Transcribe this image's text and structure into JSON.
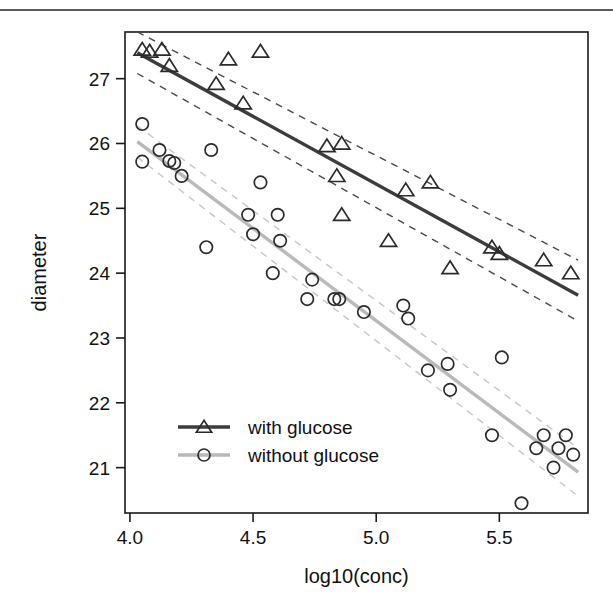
{
  "page": {
    "background_color": "#ffffff",
    "top_rule_color": "#5a5a5a"
  },
  "chart_data": {
    "type": "scatter",
    "title": "",
    "xlabel": "log10(conc)",
    "ylabel": "diameter",
    "xlim": [
      3.98,
      5.86
    ],
    "ylim": [
      20.3,
      27.72
    ],
    "xticks": [
      4.0,
      4.5,
      5.0,
      5.5
    ],
    "xticklabels": [
      "4.0",
      "4.5",
      "5.0",
      "5.5"
    ],
    "yticks": [
      21,
      22,
      23,
      24,
      25,
      26,
      27
    ],
    "yticklabels": [
      "21",
      "22",
      "23",
      "24",
      "25",
      "26",
      "27"
    ],
    "grid": false,
    "legend_position": "lower-left",
    "frame": true,
    "series": [
      {
        "name": "with glucose",
        "marker": "triangle",
        "color": "#3c3c3c",
        "legend_label": "with glucose",
        "points": [
          [
            4.05,
            27.45
          ],
          [
            4.08,
            27.42
          ],
          [
            4.13,
            27.45
          ],
          [
            4.16,
            27.2
          ],
          [
            4.35,
            26.92
          ],
          [
            4.4,
            27.3
          ],
          [
            4.46,
            26.62
          ],
          [
            4.53,
            27.42
          ],
          [
            4.8,
            25.96
          ],
          [
            4.86,
            26.0
          ],
          [
            4.84,
            25.5
          ],
          [
            4.86,
            24.9
          ],
          [
            5.05,
            24.5
          ],
          [
            5.12,
            25.28
          ],
          [
            5.22,
            25.4
          ],
          [
            5.3,
            24.08
          ],
          [
            5.47,
            24.4
          ],
          [
            5.5,
            24.3
          ],
          [
            5.68,
            24.2
          ],
          [
            5.79,
            24.0
          ]
        ],
        "fit_line": {
          "x": [
            4.03,
            5.82
          ],
          "y": [
            27.4,
            23.66
          ]
        },
        "ci_upper": {
          "x": [
            4.03,
            5.82
          ],
          "y": [
            27.72,
            24.2
          ]
        },
        "ci_lower": {
          "x": [
            4.03,
            5.82
          ],
          "y": [
            27.08,
            23.26
          ]
        }
      },
      {
        "name": "without glucose",
        "marker": "circle",
        "color": "#b9b9b9",
        "legend_label": "without glucose",
        "points": [
          [
            4.05,
            26.3
          ],
          [
            4.05,
            25.72
          ],
          [
            4.12,
            25.9
          ],
          [
            4.16,
            25.73
          ],
          [
            4.18,
            25.7
          ],
          [
            4.21,
            25.5
          ],
          [
            4.31,
            24.4
          ],
          [
            4.33,
            25.9
          ],
          [
            4.48,
            24.9
          ],
          [
            4.5,
            24.6
          ],
          [
            4.53,
            25.4
          ],
          [
            4.58,
            24.0
          ],
          [
            4.6,
            24.9
          ],
          [
            4.61,
            24.5
          ],
          [
            4.72,
            23.6
          ],
          [
            4.74,
            23.9
          ],
          [
            4.83,
            23.6
          ],
          [
            4.85,
            23.6
          ],
          [
            4.95,
            23.4
          ],
          [
            5.11,
            23.5
          ],
          [
            5.13,
            23.3
          ],
          [
            5.21,
            22.5
          ],
          [
            5.29,
            22.6
          ],
          [
            5.3,
            22.2
          ],
          [
            5.47,
            21.5
          ],
          [
            5.51,
            22.7
          ],
          [
            5.59,
            20.45
          ],
          [
            5.65,
            21.3
          ],
          [
            5.68,
            21.5
          ],
          [
            5.72,
            21.0
          ],
          [
            5.74,
            21.3
          ],
          [
            5.77,
            21.5
          ],
          [
            5.8,
            21.2
          ]
        ],
        "fit_line": {
          "x": [
            4.03,
            5.82
          ],
          "y": [
            26.03,
            20.93
          ]
        },
        "ci_upper": {
          "x": [
            4.03,
            5.82
          ],
          "y": [
            26.27,
            21.3
          ]
        },
        "ci_lower": {
          "x": [
            4.03,
            5.82
          ],
          "y": [
            25.79,
            20.56
          ]
        }
      }
    ]
  }
}
